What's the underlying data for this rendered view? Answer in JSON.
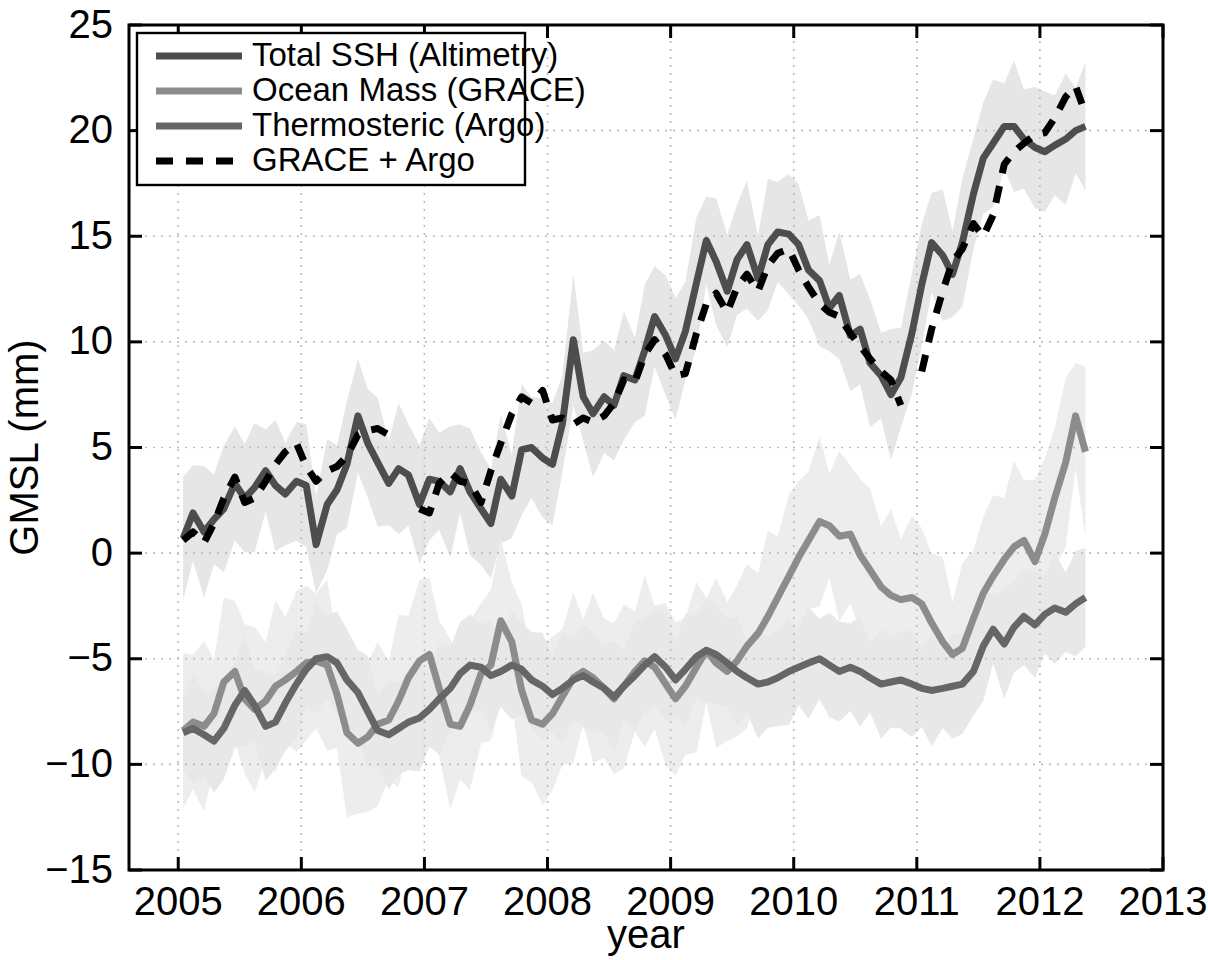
{
  "chart_data": {
    "type": "line",
    "title": "",
    "xlabel": "year",
    "ylabel": "GMSL (mm)",
    "xlim": [
      2004.6,
      2013.0
    ],
    "ylim": [
      -15,
      25
    ],
    "xticks": [
      2005,
      2006,
      2007,
      2008,
      2009,
      2010,
      2011,
      2012,
      2013
    ],
    "yticks": [
      -15,
      -10,
      -5,
      0,
      5,
      10,
      15,
      20,
      25
    ],
    "xtick_labels": [
      "2005",
      "2006",
      "2007",
      "2008",
      "2009",
      "2010",
      "2011",
      "2012",
      "2013"
    ],
    "ytick_labels": [
      "−15",
      "−10",
      "−5",
      "0",
      "5",
      "10",
      "15",
      "20",
      "25"
    ],
    "grid": true,
    "grid_style": "dotted",
    "grid_color": "#bbbbbb",
    "legend_position": "upper left",
    "series": [
      {
        "name": "Total SSH (Altimetry)",
        "key": "total_ssh",
        "color": "#4d4d4d",
        "style": "solid",
        "width": 7,
        "band": true,
        "band_color": "#e6e6e6",
        "band_half_width": 2.6,
        "x": [
          2005.04,
          2005.12,
          2005.21,
          2005.29,
          2005.37,
          2005.46,
          2005.54,
          2005.62,
          2005.71,
          2005.79,
          2005.87,
          2005.96,
          2006.04,
          2006.12,
          2006.21,
          2006.29,
          2006.37,
          2006.46,
          2006.54,
          2006.62,
          2006.71,
          2006.79,
          2006.87,
          2006.96,
          2007.04,
          2007.12,
          2007.21,
          2007.29,
          2007.37,
          2007.46,
          2007.54,
          2007.62,
          2007.71,
          2007.79,
          2007.87,
          2007.96,
          2008.04,
          2008.12,
          2008.21,
          2008.29,
          2008.37,
          2008.46,
          2008.54,
          2008.62,
          2008.71,
          2008.79,
          2008.87,
          2008.96,
          2009.04,
          2009.12,
          2009.21,
          2009.29,
          2009.37,
          2009.46,
          2009.54,
          2009.62,
          2009.71,
          2009.79,
          2009.87,
          2009.96,
          2010.04,
          2010.12,
          2010.21,
          2010.29,
          2010.37,
          2010.46,
          2010.54,
          2010.62,
          2010.71,
          2010.79,
          2010.87,
          2010.96,
          2011.04,
          2011.12,
          2011.21,
          2011.29,
          2011.37,
          2011.46,
          2011.54,
          2011.62,
          2011.71,
          2011.79,
          2011.87,
          2011.96,
          2012.04,
          2012.12,
          2012.21,
          2012.29,
          2012.37
        ],
        "y": [
          0.7,
          1.9,
          1.0,
          1.6,
          2.1,
          3.3,
          2.6,
          3.1,
          3.9,
          3.2,
          2.8,
          3.4,
          3.2,
          0.4,
          2.3,
          3.0,
          4.2,
          6.5,
          5.2,
          4.3,
          3.3,
          4.0,
          3.7,
          2.3,
          3.5,
          3.4,
          2.9,
          4.0,
          2.9,
          2.1,
          1.4,
          3.5,
          2.7,
          4.9,
          5.0,
          4.5,
          4.2,
          6.1,
          10.1,
          7.4,
          6.6,
          7.4,
          7.0,
          8.4,
          8.2,
          9.6,
          11.2,
          10.3,
          9.2,
          10.5,
          12.8,
          14.8,
          13.8,
          12.4,
          13.9,
          14.6,
          13.0,
          14.6,
          15.2,
          15.1,
          14.6,
          13.4,
          12.9,
          11.6,
          12.2,
          10.3,
          10.6,
          9.0,
          8.4,
          7.5,
          8.3,
          10.4,
          12.7,
          14.7,
          14.1,
          13.2,
          14.7,
          17.0,
          18.7,
          19.4,
          20.2,
          20.2,
          19.6,
          19.2,
          19.0,
          19.3,
          19.6,
          20.0,
          20.2
        ]
      },
      {
        "name": "Ocean Mass (GRACE)",
        "key": "ocean_mass",
        "color": "#8c8c8c",
        "style": "solid",
        "width": 7,
        "band": true,
        "band_color": "#ededed",
        "band_half_width": 3.4,
        "x": [
          2005.04,
          2005.12,
          2005.21,
          2005.29,
          2005.37,
          2005.46,
          2005.54,
          2005.62,
          2005.71,
          2005.79,
          2005.87,
          2005.96,
          2006.04,
          2006.12,
          2006.21,
          2006.29,
          2006.37,
          2006.46,
          2006.54,
          2006.62,
          2006.71,
          2006.79,
          2006.87,
          2006.96,
          2007.04,
          2007.12,
          2007.21,
          2007.29,
          2007.37,
          2007.46,
          2007.54,
          2007.62,
          2007.71,
          2007.79,
          2007.87,
          2007.96,
          2008.04,
          2008.12,
          2008.21,
          2008.29,
          2008.37,
          2008.46,
          2008.54,
          2008.62,
          2008.71,
          2008.79,
          2008.87,
          2008.96,
          2009.04,
          2009.12,
          2009.21,
          2009.29,
          2009.37,
          2009.46,
          2009.54,
          2009.62,
          2009.71,
          2009.79,
          2009.87,
          2009.96,
          2010.04,
          2010.12,
          2010.21,
          2010.29,
          2010.37,
          2010.46,
          2010.54,
          2010.62,
          2010.71,
          2010.79,
          2010.87,
          2010.96,
          2011.04,
          2011.12,
          2011.21,
          2011.29,
          2011.37,
          2011.46,
          2011.54,
          2011.62,
          2011.71,
          2011.79,
          2011.87,
          2011.96,
          2012.04,
          2012.12,
          2012.21,
          2012.29,
          2012.37
        ],
        "y": [
          -8.4,
          -8.0,
          -8.2,
          -7.6,
          -6.1,
          -5.6,
          -6.9,
          -7.4,
          -7.0,
          -6.3,
          -6.0,
          -5.6,
          -5.2,
          -5.1,
          -5.3,
          -6.7,
          -8.5,
          -9.0,
          -8.7,
          -8.1,
          -7.9,
          -7.0,
          -5.9,
          -5.1,
          -4.8,
          -6.4,
          -8.1,
          -8.2,
          -7.2,
          -5.7,
          -5.3,
          -3.2,
          -4.2,
          -6.5,
          -7.9,
          -8.1,
          -7.6,
          -6.8,
          -5.9,
          -5.6,
          -5.9,
          -6.4,
          -6.9,
          -6.3,
          -5.6,
          -5.1,
          -5.4,
          -6.2,
          -6.9,
          -6.3,
          -5.4,
          -4.6,
          -5.2,
          -5.6,
          -5.1,
          -4.4,
          -3.8,
          -3.0,
          -2.1,
          -1.1,
          -0.2,
          0.6,
          1.5,
          1.3,
          0.8,
          0.9,
          -0.1,
          -0.8,
          -1.6,
          -2.0,
          -2.2,
          -2.1,
          -2.4,
          -3.3,
          -4.2,
          -4.8,
          -4.5,
          -3.1,
          -1.9,
          -1.1,
          -0.3,
          0.3,
          0.6,
          -0.4,
          0.9,
          2.6,
          4.3,
          6.5,
          4.8
        ]
      },
      {
        "name": "Thermosteric (Argo)",
        "key": "thermosteric",
        "color": "#666666",
        "style": "solid",
        "width": 7,
        "band": true,
        "band_color": "#e8e8e8",
        "band_half_width": 2.2,
        "x": [
          2005.04,
          2005.12,
          2005.21,
          2005.29,
          2005.37,
          2005.46,
          2005.54,
          2005.62,
          2005.71,
          2005.79,
          2005.87,
          2005.96,
          2006.04,
          2006.12,
          2006.21,
          2006.29,
          2006.37,
          2006.46,
          2006.54,
          2006.62,
          2006.71,
          2006.79,
          2006.87,
          2006.96,
          2007.04,
          2007.12,
          2007.21,
          2007.29,
          2007.37,
          2007.46,
          2007.54,
          2007.62,
          2007.71,
          2007.79,
          2007.87,
          2007.96,
          2008.04,
          2008.12,
          2008.21,
          2008.29,
          2008.37,
          2008.46,
          2008.54,
          2008.62,
          2008.71,
          2008.79,
          2008.87,
          2008.96,
          2009.04,
          2009.12,
          2009.21,
          2009.29,
          2009.37,
          2009.46,
          2009.54,
          2009.62,
          2009.71,
          2009.79,
          2009.87,
          2009.96,
          2010.04,
          2010.12,
          2010.21,
          2010.29,
          2010.37,
          2010.46,
          2010.54,
          2010.62,
          2010.71,
          2010.79,
          2010.87,
          2010.96,
          2011.04,
          2011.12,
          2011.21,
          2011.29,
          2011.37,
          2011.46,
          2011.54,
          2011.62,
          2011.71,
          2011.79,
          2011.87,
          2011.96,
          2012.04,
          2012.12,
          2012.21,
          2012.29,
          2012.37
        ],
        "y": [
          -8.5,
          -8.3,
          -8.6,
          -8.9,
          -8.3,
          -7.2,
          -6.5,
          -7.2,
          -8.2,
          -8.0,
          -7.1,
          -6.2,
          -5.5,
          -5.0,
          -4.9,
          -5.2,
          -6.0,
          -6.6,
          -7.5,
          -8.4,
          -8.6,
          -8.3,
          -8.0,
          -7.8,
          -7.4,
          -6.9,
          -6.4,
          -5.7,
          -5.3,
          -5.4,
          -5.8,
          -5.6,
          -5.3,
          -5.5,
          -6.0,
          -6.3,
          -6.7,
          -6.4,
          -6.0,
          -5.8,
          -6.1,
          -6.4,
          -6.8,
          -6.3,
          -5.8,
          -5.3,
          -4.9,
          -5.4,
          -6.0,
          -5.5,
          -4.9,
          -4.6,
          -4.8,
          -5.2,
          -5.6,
          -5.9,
          -6.2,
          -6.1,
          -5.9,
          -5.6,
          -5.4,
          -5.2,
          -5.0,
          -5.3,
          -5.6,
          -5.4,
          -5.6,
          -5.9,
          -6.2,
          -6.1,
          -6.0,
          -6.2,
          -6.4,
          -6.5,
          -6.4,
          -6.3,
          -6.2,
          -5.6,
          -4.4,
          -3.6,
          -4.3,
          -3.5,
          -3.0,
          -3.4,
          -2.9,
          -2.6,
          -2.8,
          -2.4,
          -2.1
        ]
      },
      {
        "name": "GRACE + Argo",
        "key": "grace_plus_argo",
        "color": "#000000",
        "style": "dashed",
        "width": 7,
        "band": false,
        "segments": [
          {
            "x": [
              2005.04,
              2005.12,
              2005.21,
              2005.29,
              2005.37,
              2005.46,
              2005.54,
              2005.62,
              2005.71,
              2005.79,
              2005.87,
              2005.96,
              2006.04,
              2006.12,
              2006.21,
              2006.29,
              2006.37,
              2006.46,
              2006.54,
              2006.62,
              2006.71,
              2006.79
            ],
            "y": [
              0.6,
              1.0,
              0.5,
              1.4,
              2.6,
              3.6,
              2.4,
              2.6,
              3.4,
              4.2,
              4.8,
              5.2,
              4.1,
              3.4,
              3.9,
              4.1,
              4.6,
              5.6,
              5.8,
              5.9,
              5.6,
              5.4
            ]
          },
          {
            "x": [
              2006.96,
              2007.04,
              2007.12,
              2007.21,
              2007.29,
              2007.37,
              2007.46,
              2007.54,
              2007.62,
              2007.71,
              2007.79,
              2007.87,
              2007.96,
              2008.04,
              2008.12,
              2008.21,
              2008.29,
              2008.37,
              2008.46,
              2008.54,
              2008.62,
              2008.71,
              2008.79,
              2008.87,
              2008.96,
              2009.04,
              2009.12,
              2009.21,
              2009.29,
              2009.37,
              2009.46,
              2009.54,
              2009.62,
              2009.71,
              2009.79,
              2009.87,
              2009.96,
              2010.04,
              2010.12,
              2010.21,
              2010.29,
              2010.37,
              2010.46,
              2010.54,
              2010.62,
              2010.71,
              2010.79,
              2010.87
            ],
            "y": [
              2.1,
              1.9,
              3.3,
              3.8,
              3.4,
              3.3,
              2.4,
              3.9,
              5.2,
              6.6,
              7.4,
              7.1,
              7.7,
              6.3,
              6.4,
              6.1,
              6.4,
              6.2,
              6.5,
              7.1,
              8.2,
              8.1,
              9.4,
              10.1,
              9.4,
              8.4,
              8.5,
              10.4,
              11.8,
              12.3,
              11.4,
              12.6,
              13.2,
              12.4,
              13.6,
              14.2,
              14.4,
              13.4,
              12.6,
              11.8,
              11.4,
              11.2,
              10.4,
              9.8,
              9.2,
              8.6,
              8.2,
              7.0
            ]
          },
          {
            "x": [
              2011.04,
              2011.12,
              2011.21,
              2011.29,
              2011.37,
              2011.46,
              2011.54,
              2011.62,
              2011.71,
              2011.79,
              2011.87,
              2011.96,
              2012.04,
              2012.12,
              2012.21,
              2012.29,
              2012.37
            ],
            "y": [
              8.6,
              10.6,
              12.4,
              13.8,
              14.4,
              15.6,
              15.0,
              16.0,
              18.4,
              19.0,
              19.4,
              19.8,
              19.9,
              20.6,
              21.6,
              22.1,
              20.8
            ]
          }
        ]
      }
    ]
  },
  "legend": {
    "items": [
      {
        "label": "Total SSH (Altimetry)",
        "series_key": "total_ssh"
      },
      {
        "label": "Ocean Mass (GRACE)",
        "series_key": "ocean_mass"
      },
      {
        "label": "Thermosteric (Argo)",
        "series_key": "thermosteric"
      },
      {
        "label": "GRACE + Argo",
        "series_key": "grace_plus_argo"
      }
    ]
  },
  "axes": {
    "x_label": "year",
    "y_label": "GMSL (mm)"
  }
}
